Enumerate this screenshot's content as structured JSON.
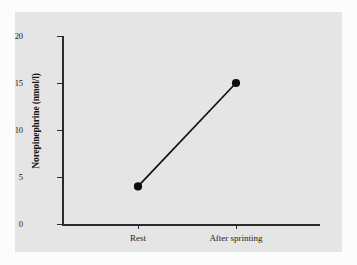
{
  "chart_data": {
    "type": "line",
    "title": "",
    "xlabel": "",
    "ylabel": "Norepinephrine (nmol/l)",
    "categories": [
      "Rest",
      "After sprinting"
    ],
    "values": [
      4,
      15
    ],
    "series": [
      {
        "name": "Norepinephrine",
        "values": [
          4,
          15
        ]
      }
    ],
    "ylim": [
      0,
      20
    ],
    "yticks": [
      0,
      5,
      10,
      15,
      20
    ],
    "ytick_labels": [
      "0",
      "5",
      "10",
      "15",
      "20"
    ],
    "grid": false,
    "legend": false,
    "legend_position": "none",
    "marker": "filled-circle",
    "line_color": "#111111",
    "marker_color": "#0d0d0d",
    "panel_background": "#e5e5e5",
    "page_background": "#fcfcfc",
    "axis_color": "#2b2b2b"
  },
  "axes": {
    "y": {
      "title": "Norepinephrine (nmol/l)",
      "ticks": [
        {
          "label": "20",
          "value": 20
        },
        {
          "label": "15",
          "value": 15
        },
        {
          "label": "10",
          "value": 10
        },
        {
          "label": "5",
          "value": 5
        },
        {
          "label": "0",
          "value": 0
        }
      ]
    },
    "x": {
      "title": "",
      "ticks": [
        {
          "label": "Rest"
        },
        {
          "label": "After sprinting"
        }
      ]
    }
  }
}
